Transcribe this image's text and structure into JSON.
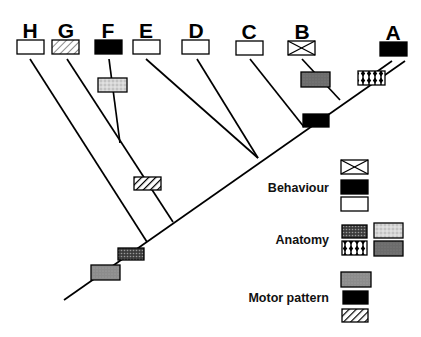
{
  "diagram": {
    "type": "cladogram",
    "taxa": [
      {
        "id": "H",
        "label": "H",
        "character": "open"
      },
      {
        "id": "G",
        "label": "G",
        "character": "light-hatch"
      },
      {
        "id": "F",
        "label": "F",
        "character": "black"
      },
      {
        "id": "E",
        "label": "E",
        "character": "open"
      },
      {
        "id": "D",
        "label": "D",
        "character": "open"
      },
      {
        "id": "C",
        "label": "C",
        "character": "open"
      },
      {
        "id": "B",
        "label": "B",
        "character": "cross"
      },
      {
        "id": "A",
        "label": "A",
        "character": "black"
      }
    ],
    "branch_characters": [
      {
        "on": "F branch",
        "fill": "light-stipple"
      },
      {
        "on": "B branch",
        "fill": "dark-gray"
      },
      {
        "on": "A branch",
        "fill": "diamond-pattern"
      },
      {
        "on": "A+B clade",
        "fill": "black"
      },
      {
        "on": "G+F clade",
        "fill": "diagonal-hatch"
      },
      {
        "on": "trunk (above base)",
        "fill": "dark-stipple"
      },
      {
        "on": "trunk (base)",
        "fill": "medium-gray"
      }
    ]
  },
  "legend": {
    "groups": [
      {
        "label": "Behaviour",
        "swatches": [
          "cross",
          "black",
          "open"
        ]
      },
      {
        "label": "Anatomy",
        "swatches": [
          "dark-stipple",
          "light-stipple",
          "diamond-pattern",
          "dark-gray"
        ]
      },
      {
        "label": "Motor pattern",
        "swatches": [
          "medium-gray",
          "black",
          "diagonal-hatch"
        ]
      }
    ]
  },
  "colors": {
    "ink": "#000000",
    "background": "#ffffff",
    "light_stipple": "#c8c8c8",
    "dark_gray": "#6e6e6e",
    "medium_gray": "#8a8a8a",
    "dark_stipple": "#555555"
  }
}
